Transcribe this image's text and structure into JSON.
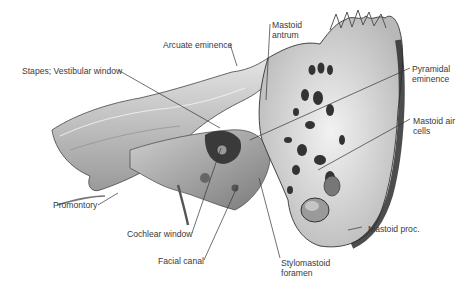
{
  "figure": {
    "labels": {
      "arcuate_eminence": "Arcuate eminence",
      "mastoid_antrum_1": "Mastoid",
      "mastoid_antrum_2": "antrum",
      "stapes_vestibular_window": "Stapes; Vestibular window",
      "pyramidal_eminence_1": "Pyramidal",
      "pyramidal_eminence_2": "eminence",
      "mastoid_air_cells_1": "Mastoid air",
      "mastoid_air_cells_2": "cells",
      "promontory": "Promontory",
      "cochlear_window": "Cochlear window",
      "facial_canal": "Facial canal",
      "stylomastoid_foramen_1": "Stylomastoid",
      "stylomastoid_foramen_2": "foramen",
      "mastoid_process": "Mastoid proc."
    },
    "colors": {
      "bone_light": "#d9d9d9",
      "bone_mid": "#a8a8a8",
      "bone_dark": "#5a5a5a",
      "cavity": "#2a2a2a",
      "leader": "#333333",
      "text": "#3a3a3a"
    }
  }
}
